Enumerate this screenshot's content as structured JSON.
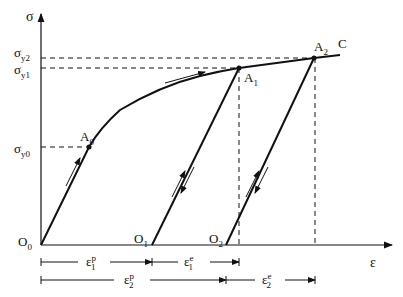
{
  "diagram": {
    "axes": {
      "y_label": "σ",
      "x_label": "ε"
    },
    "stress_levels": [
      {
        "id": "sigma_y2",
        "base": "σ",
        "sub": "y2"
      },
      {
        "id": "sigma_y1",
        "base": "σ",
        "sub": "y1"
      },
      {
        "id": "sigma_y0",
        "base": "σ",
        "sub": "y0"
      }
    ],
    "points": [
      {
        "id": "O0",
        "base": "O",
        "sub": "0"
      },
      {
        "id": "O1",
        "base": "O",
        "sub": "1"
      },
      {
        "id": "O2",
        "base": "O",
        "sub": "2"
      },
      {
        "id": "A0",
        "base": "A",
        "sub": "0"
      },
      {
        "id": "A1",
        "base": "A",
        "sub": "1"
      },
      {
        "id": "A2",
        "base": "A",
        "sub": "2"
      },
      {
        "id": "C",
        "base": "C",
        "sub": ""
      }
    ],
    "strain_dimensions": [
      {
        "id": "eps1p",
        "base": "ε",
        "sub": "1",
        "sup": "p"
      },
      {
        "id": "eps1e",
        "base": "ε",
        "sub": "1",
        "sup": "e"
      },
      {
        "id": "eps2p",
        "base": "ε",
        "sub": "2",
        "sup": "p"
      },
      {
        "id": "eps2e",
        "base": "ε",
        "sub": "2",
        "sup": "e"
      }
    ],
    "colors": {
      "line": "#111111",
      "background": "#ffffff"
    }
  }
}
